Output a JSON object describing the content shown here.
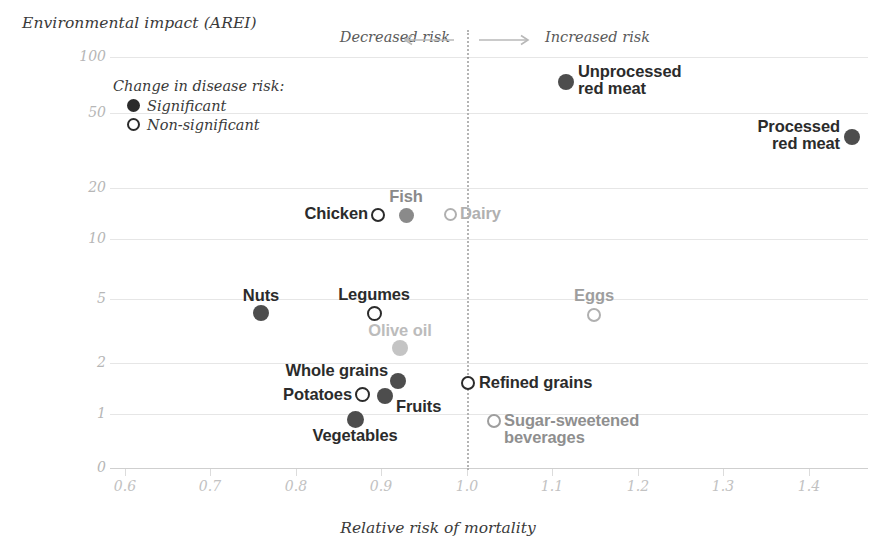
{
  "chart_data": {
    "type": "scatter",
    "title": "",
    "xlabel": "Relative risk of mortality",
    "ylabel": "Environmental impact (AREI)",
    "xlim": [
      0.55,
      1.45
    ],
    "ylim": [
      0,
      130
    ],
    "yscale": "log-like",
    "grid": true,
    "xticks": [
      "0.6",
      "0.7",
      "0.8",
      "0.9",
      "1.0",
      "1.1",
      "1.2",
      "1.3",
      "1.4"
    ],
    "xtick_values": [
      0.6,
      0.7,
      0.8,
      0.9,
      1.0,
      1.1,
      1.2,
      1.3,
      1.4
    ],
    "yticks": [
      "100",
      "50",
      "20",
      "10",
      "5",
      "2",
      "1",
      "0"
    ],
    "ytick_values": [
      100,
      50,
      20,
      10,
      5,
      2,
      1,
      0
    ],
    "reference_line_x": 1.0,
    "annotations": {
      "left_direction": "Decreased risk",
      "right_direction": "Increased risk"
    },
    "legend": {
      "title": "Change in disease risk:",
      "position": "top-left-inside",
      "entries": [
        {
          "label": "Significant",
          "marker": "filled"
        },
        {
          "label": "Non-significant",
          "marker": "hollow"
        }
      ]
    },
    "points": [
      {
        "name": "Unprocessed red meat",
        "label": "Unprocessed\nred meat",
        "x": 1.115,
        "y": 70,
        "significance": "Significant",
        "marker": "filled",
        "color": "#4d4d4d",
        "label_color": "#2b2b2b",
        "label_x": 578,
        "label_y": 63,
        "label_align": "left",
        "px": 566,
        "py": 82,
        "r": 8
      },
      {
        "name": "Processed red meat",
        "label": "Processed\nred meat",
        "x": 1.41,
        "y": 38,
        "significance": "Significant",
        "marker": "filled",
        "color": "#4d4d4d",
        "label_color": "#2b2b2b",
        "label_x": 840,
        "label_y": 118,
        "label_align": "right",
        "px": 852,
        "py": 137,
        "r": 8
      },
      {
        "name": "Chicken",
        "label": "Chicken",
        "x": 0.895,
        "y": 14.5,
        "significance": "Non-significant",
        "marker": "hollow",
        "color": "#2b2b2b",
        "label_color": "#2b2b2b",
        "label_x": 368,
        "label_y": 205,
        "label_align": "right",
        "px": 378,
        "py": 215,
        "r": 7
      },
      {
        "name": "Fish",
        "label": "Fish",
        "x": 0.925,
        "y": 14.5,
        "significance": "Significant",
        "marker": "filled",
        "color": "#8a8a8a",
        "label_color": "#8a8a8a",
        "label_x": 406,
        "label_y": 188,
        "label_align": "center",
        "px": 406,
        "py": 215,
        "r": 7.5
      },
      {
        "name": "Dairy",
        "label": "Dairy",
        "x": 0.975,
        "y": 14,
        "significance": "Non-significant",
        "marker": "hollow",
        "color": "#b0b0b0",
        "label_color": "#b0b0b0",
        "label_x": 460,
        "label_y": 205,
        "label_align": "left",
        "px": 450,
        "py": 214,
        "r": 6.5
      },
      {
        "name": "Nuts",
        "label": "Nuts",
        "x": 0.763,
        "y": 4.2,
        "significance": "Significant",
        "marker": "filled",
        "color": "#4d4d4d",
        "label_color": "#2b2b2b",
        "label_x": 261,
        "label_y": 287,
        "label_align": "center",
        "px": 261,
        "py": 313,
        "r": 8
      },
      {
        "name": "Legumes",
        "label": "Legumes",
        "x": 0.888,
        "y": 3.8,
        "significance": "Non-significant",
        "marker": "hollow",
        "color": "#2b2b2b",
        "label_color": "#2b2b2b",
        "label_x": 374,
        "label_y": 286,
        "label_align": "center",
        "px": 374,
        "py": 313,
        "r": 7.5
      },
      {
        "name": "Eggs",
        "label": "Eggs",
        "x": 1.148,
        "y": 4.0,
        "significance": "Non-significant",
        "marker": "hollow",
        "color": "#b0b0b0",
        "label_color": "#9e9e9e",
        "label_x": 594,
        "label_y": 287,
        "label_align": "center",
        "px": 594,
        "py": 315,
        "r": 7
      },
      {
        "name": "Olive oil",
        "label": "Olive oil",
        "x": 0.918,
        "y": 2.4,
        "significance": "Significant",
        "marker": "filled",
        "color": "#c4c4c4",
        "label_color": "#bcbcbc",
        "label_x": 400,
        "label_y": 322,
        "label_align": "center",
        "px": 400,
        "py": 348,
        "r": 8
      },
      {
        "name": "Whole grains",
        "label": "Whole grains",
        "x": 0.918,
        "y": 1.72,
        "significance": "Significant",
        "marker": "filled",
        "color": "#4d4d4d",
        "label_color": "#2b2b2b",
        "label_x": 388,
        "label_y": 362,
        "label_align": "right",
        "px": 398,
        "py": 381,
        "r": 8
      },
      {
        "name": "Refined grains",
        "label": "Refined grains",
        "x": 1.0,
        "y": 1.66,
        "significance": "Non-significant",
        "marker": "hollow",
        "color": "#2b2b2b",
        "label_color": "#2b2b2b",
        "label_x": 479,
        "label_y": 374,
        "label_align": "left",
        "px": 468,
        "py": 383,
        "r": 7
      },
      {
        "name": "Potatoes",
        "label": "Potatoes",
        "x": 0.873,
        "y": 1.4,
        "significance": "Non-significant",
        "marker": "hollow",
        "color": "#2b2b2b",
        "label_color": "#2b2b2b",
        "label_x": 352,
        "label_y": 386,
        "label_align": "right",
        "px": 362,
        "py": 394,
        "r": 7.5
      },
      {
        "name": "Fruits",
        "label": "Fruits",
        "x": 0.898,
        "y": 1.38,
        "significance": "Significant",
        "marker": "filled",
        "color": "#4d4d4d",
        "label_color": "#2b2b2b",
        "label_x": 396,
        "label_y": 398,
        "label_align": "left",
        "px": 385,
        "py": 396,
        "r": 8
      },
      {
        "name": "Vegetables",
        "label": "Vegetables",
        "x": 0.868,
        "y": 1.0,
        "significance": "Significant",
        "marker": "filled",
        "color": "#4d4d4d",
        "label_color": "#2b2b2b",
        "label_x": 355,
        "label_y": 427,
        "label_align": "center",
        "px": 355,
        "py": 419,
        "r": 8.5
      },
      {
        "name": "Sugar-sweetened beverages",
        "label": "Sugar-sweetened\nbeverages",
        "x": 1.027,
        "y": 0.95,
        "significance": "Non-significant",
        "marker": "hollow",
        "color": "#9e9e9e",
        "label_color": "#8f8f8f",
        "label_x": 504,
        "label_y": 412,
        "label_align": "left",
        "px": 494,
        "py": 421,
        "r": 7
      }
    ]
  },
  "colors": {
    "grid": "#e6e6e6",
    "tick_text": "#c2c2c2",
    "axis_title": "#3a3a3a",
    "reference_line": "#b4b4b4",
    "dark_marker": "#4d4d4d",
    "mid_marker": "#8a8a8a",
    "light_marker": "#c4c4c4"
  },
  "geometry": {
    "gridlines": [
      {
        "label": "100",
        "py": 57
      },
      {
        "label": "50",
        "py": 113
      },
      {
        "label": "20",
        "py": 188
      },
      {
        "label": "10",
        "py": 239
      },
      {
        "label": "5",
        "py": 299
      },
      {
        "label": "2",
        "py": 363
      },
      {
        "label": "1",
        "py": 414
      },
      {
        "label": "0",
        "py": 468
      }
    ],
    "xticks": [
      {
        "label": "0.6",
        "px": 125
      },
      {
        "label": "0.7",
        "px": 210
      },
      {
        "label": "0.8",
        "px": 296
      },
      {
        "label": "0.9",
        "px": 381
      },
      {
        "label": "1.0",
        "px": 467
      },
      {
        "label": "1.1",
        "px": 552
      },
      {
        "label": "1.2",
        "px": 638
      },
      {
        "label": "1.3",
        "px": 723
      },
      {
        "label": "1.4",
        "px": 809
      }
    ],
    "reference_line_px": 467
  }
}
